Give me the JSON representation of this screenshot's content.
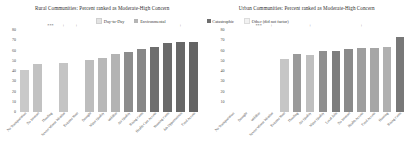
{
  "figure": {
    "background": "#ffffff"
  },
  "colors": {
    "day_to_day": "#e3e3e3",
    "environmental": "#b5b5b5",
    "catastrophic": "#6e6e6e",
    "other": "#f2f2f2",
    "text": "#2f2f2f"
  },
  "legend": {
    "row1": [
      {
        "label": "Day-to-Day",
        "color": "#e3e3e3"
      },
      {
        "label": "Environmental",
        "color": "#b5b5b5"
      }
    ],
    "row2": [
      {
        "label": "Catastrophic",
        "color": "#6e6e6e"
      },
      {
        "label": "Other (did not factor)",
        "color": "#f2f2f2"
      }
    ]
  },
  "chart_data": [
    {
      "type": "bar",
      "title": "Rural Communities: Percent ranked as Moderate-High Concern",
      "xlabel": "",
      "ylabel": "",
      "ylim": [
        0,
        80
      ],
      "yticks": [
        0,
        10,
        20,
        30,
        40,
        50,
        60,
        70,
        80
      ],
      "ytick_labels": [
        "0",
        "10",
        "20",
        "30",
        "40",
        "50",
        "60",
        "70",
        "80"
      ],
      "grid": false,
      "legend_position": "top-right",
      "categories": [
        "No Transportation",
        "No Internet",
        "Flooding",
        "Severe Winter Weather",
        "Extreme Heat",
        "Drought",
        "Water Quality",
        "Wildfire",
        "Air Quality",
        "Rising Costs",
        "Health Care Access",
        "Housing Costs",
        "Job Opportunities",
        "Food Access"
      ],
      "values": [
        41,
        47,
        0,
        48,
        0,
        51,
        53,
        57,
        59,
        61,
        63,
        67,
        68,
        68
      ],
      "series": [
        {
          "name": "bars",
          "values": [
            41,
            47,
            0,
            48,
            0,
            51,
            53,
            57,
            59,
            61,
            63,
            67,
            68,
            68
          ],
          "colors": [
            "#c9c9c9",
            "#c2c2c2",
            "#f4f4f4",
            "#c4c4c4",
            "#f4f4f4",
            "#bdbdbd",
            "#b8b8b8",
            "#b3b3b3",
            "#8c8c8c",
            "#878787",
            "#6e6e6e",
            "#6a6a6a",
            "#676767",
            "#646464"
          ]
        }
      ],
      "significance": [
        "",
        "",
        "***",
        "+",
        "+",
        "",
        "",
        "",
        "",
        "",
        "",
        "",
        "+",
        ""
      ]
    },
    {
      "type": "bar",
      "title": "Urban Communities: Percent ranked as Moderate-High Concern",
      "xlabel": "",
      "ylabel": "",
      "ylim": [
        0,
        80
      ],
      "yticks": [
        10,
        20,
        30,
        40,
        50,
        60,
        70,
        80
      ],
      "ytick_labels": [
        "10",
        "20",
        "30",
        "40",
        "50",
        "60",
        "70",
        "80"
      ],
      "grid": false,
      "legend_position": "top-left",
      "categories": [
        "No Transportation",
        "Drought",
        "Wildfire",
        "Severe Winter Weather",
        "Extreme Heat",
        "Flooding",
        "Air Quality",
        "Water Quality",
        "Local Jobs",
        "No Internet",
        "Health Access",
        "Food Access",
        "Housing",
        "Rising Costs"
      ],
      "values": [
        0,
        0,
        0,
        0,
        52,
        57,
        56,
        60,
        60,
        61,
        62,
        62,
        63,
        73
      ],
      "series": [
        {
          "name": "bars",
          "values": [
            0,
            0,
            0,
            0,
            52,
            57,
            56,
            60,
            60,
            61,
            62,
            62,
            63,
            73
          ],
          "colors": [
            "#f6f6f6",
            "#f6f6f6",
            "#f6f6f6",
            "#efefef",
            "#c6c6c6",
            "#9a9a9a",
            "#bfbfbf",
            "#8f8f8f",
            "#7d7d7d",
            "#8a8a8a",
            "#9e9e9e",
            "#a6a6a6",
            "#b0b0b0",
            "#787878"
          ]
        }
      ],
      "significance": [
        "",
        "",
        "***",
        "+",
        "",
        "",
        "+",
        "",
        "",
        "",
        "+",
        "",
        "",
        ""
      ]
    }
  ]
}
